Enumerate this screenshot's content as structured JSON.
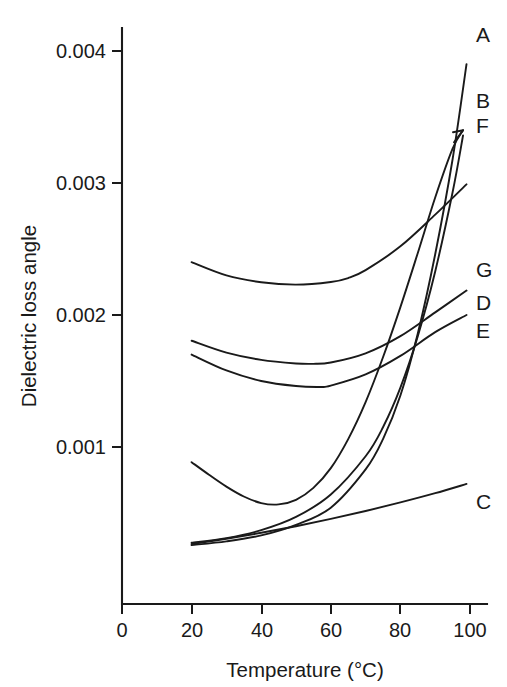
{
  "chart_data": {
    "type": "line",
    "title": "",
    "xlabel": "Temperature (°C)",
    "ylabel": "Dielectric loss angle",
    "xlim": [
      0,
      104
    ],
    "ylim": [
      0,
      0.00425
    ],
    "grid": false,
    "legend_position": "right-curve-ends",
    "xticks": [
      "0",
      "20",
      "40",
      "60",
      "80",
      "100"
    ],
    "xtick_values": [
      0,
      20,
      40,
      60,
      80,
      100
    ],
    "yticks": [
      "0.001",
      "0.002",
      "0.003",
      "0.004"
    ],
    "ytick_values": [
      0.001,
      0.002,
      0.003,
      0.004
    ],
    "series": [
      {
        "name": "A",
        "label": "A",
        "x": [
          20,
          30,
          40,
          50,
          60,
          70,
          75,
          80,
          85,
          90,
          95,
          99
        ],
        "values": [
          0.000257,
          0.000285,
          0.00033,
          0.00041,
          0.00054,
          0.00083,
          0.00106,
          0.00139,
          0.00186,
          0.00246,
          0.00318,
          0.0039
        ]
      },
      {
        "name": "B",
        "label": "B",
        "x": [
          20,
          30,
          40,
          50,
          60,
          70,
          75,
          80,
          85,
          90,
          95,
          98
        ],
        "values": [
          0.000275,
          0.00031,
          0.00037,
          0.00047,
          0.00064,
          0.00093,
          0.00115,
          0.00145,
          0.00184,
          0.00233,
          0.00293,
          0.00336
        ]
      },
      {
        "name": "C",
        "label": "C",
        "x": [
          20,
          30,
          40,
          50,
          60,
          70,
          80,
          90,
          99
        ],
        "values": [
          0.000265,
          0.000305,
          0.00035,
          0.0004,
          0.000455,
          0.000515,
          0.00058,
          0.00065,
          0.00072
        ]
      },
      {
        "name": "D",
        "label": "D",
        "x": [
          20,
          30,
          40,
          50,
          55,
          60,
          70,
          80,
          90,
          99
        ],
        "values": [
          0.001805,
          0.001715,
          0.00166,
          0.001633,
          0.00163,
          0.00164,
          0.00171,
          0.00184,
          0.00202,
          0.002185
        ]
      },
      {
        "name": "E",
        "label": "E",
        "x": [
          20,
          30,
          40,
          50,
          57,
          60,
          70,
          80,
          90,
          99
        ],
        "values": [
          0.0017,
          0.00158,
          0.0015,
          0.001462,
          0.001455,
          0.001465,
          0.00155,
          0.00169,
          0.00187,
          0.002
        ]
      },
      {
        "name": "F",
        "label": "F",
        "x": [
          20,
          25,
          30,
          35,
          40,
          45,
          50,
          55,
          60,
          65,
          70,
          75,
          80,
          85,
          90,
          95,
          98
        ],
        "values": [
          0.000885,
          0.00079,
          0.0007,
          0.000625,
          0.000575,
          0.000565,
          0.0006,
          0.00069,
          0.00084,
          0.00106,
          0.00134,
          0.00168,
          0.00206,
          0.00247,
          0.00289,
          0.00326,
          0.0034
        ]
      },
      {
        "name": "G",
        "label": "G",
        "x": [
          20,
          30,
          40,
          50,
          60,
          65,
          70,
          80,
          90,
          99
        ],
        "values": [
          0.0024,
          0.0023,
          0.002248,
          0.00223,
          0.00225,
          0.00228,
          0.00234,
          0.00252,
          0.00276,
          0.00299
        ]
      }
    ]
  },
  "labels": {
    "y_axis_title": "Dielectric loss angle",
    "x_axis_title": "Temperature (°C)",
    "series_A": "A",
    "series_B": "B",
    "series_C": "C",
    "series_D": "D",
    "series_E": "E",
    "series_F": "F",
    "series_G": "G",
    "ytick_0": "0.001",
    "ytick_1": "0.002",
    "ytick_2": "0.003",
    "ytick_3": "0.004",
    "xtick_0": "0",
    "xtick_1": "20",
    "xtick_2": "40",
    "xtick_3": "60",
    "xtick_4": "80",
    "xtick_5": "100"
  },
  "colors": {
    "ink": "#1a1a1a",
    "background": "#ffffff"
  }
}
